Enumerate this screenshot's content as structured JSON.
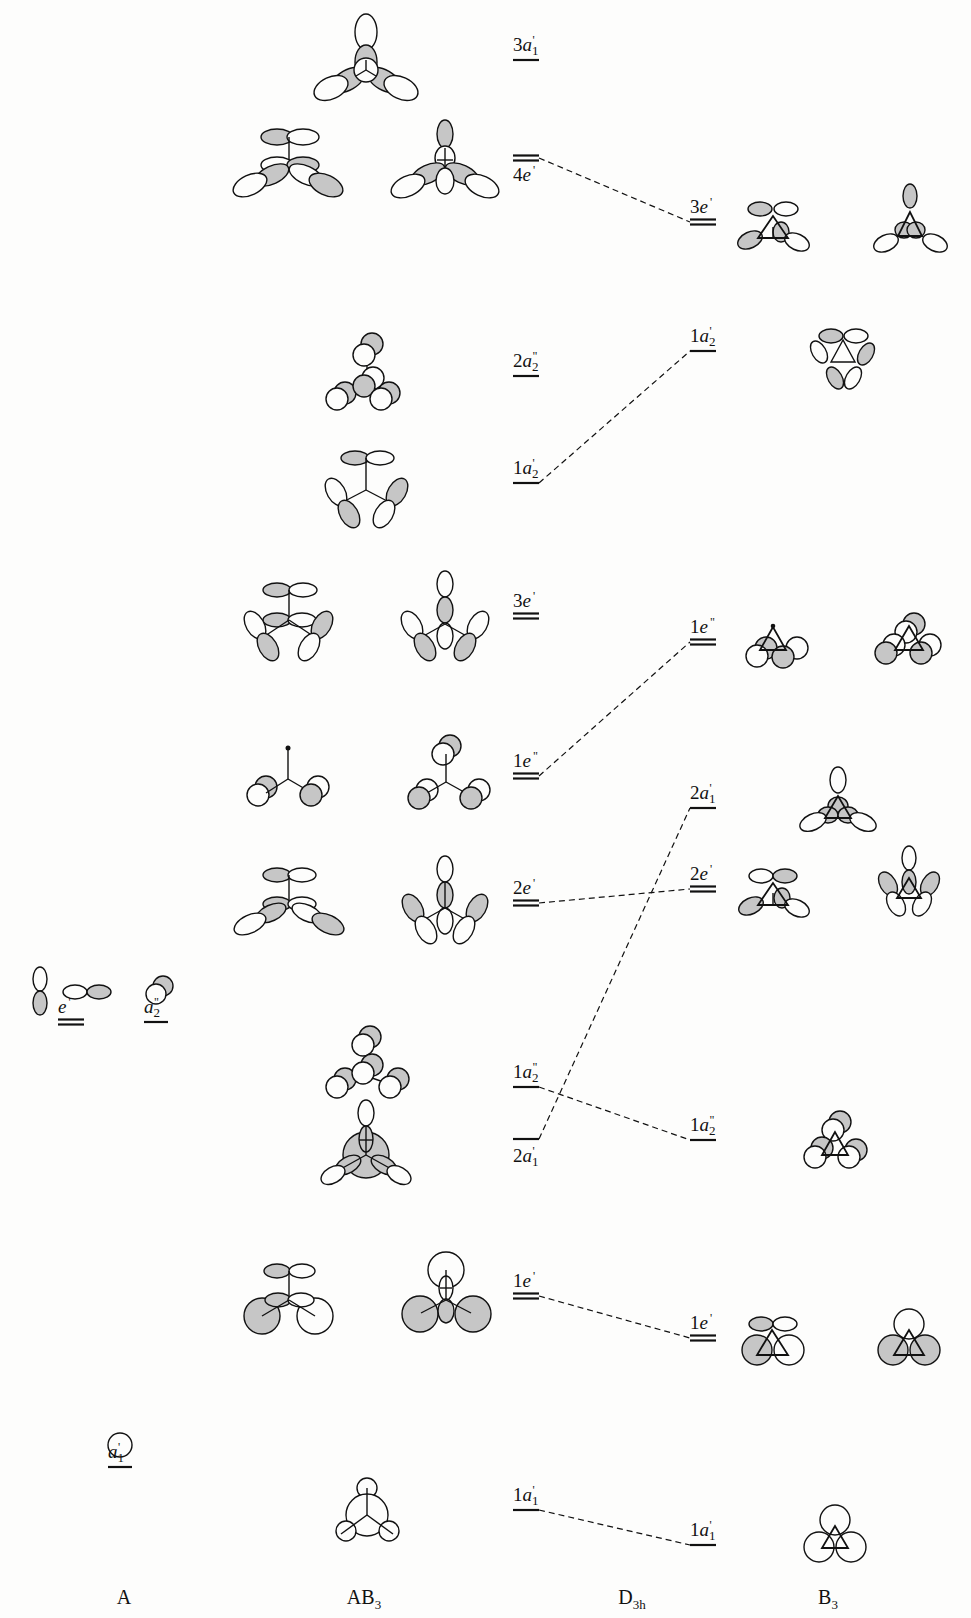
{
  "columns": [
    {
      "id": "A",
      "text": "A",
      "sub": "",
      "x": 124
    },
    {
      "id": "AB3",
      "text": "AB",
      "sub": "3",
      "x": 364
    },
    {
      "id": "D3h",
      "text": "D",
      "sub": "3h",
      "x": 632
    },
    {
      "id": "B3",
      "text": "B",
      "sub": "3",
      "x": 828
    }
  ],
  "levels": {
    "A": [
      {
        "id": "A-a1p",
        "num": "",
        "sym": "a",
        "sub": "1",
        "prime": "'",
        "y": 1467,
        "x": 108,
        "w": 24,
        "degenerate": false,
        "labelAbove": true
      },
      {
        "id": "A-ep",
        "num": "",
        "sym": "e",
        "sub": "",
        "prime": "'",
        "y": 1022,
        "x": 58,
        "w": 26,
        "degenerate": true,
        "labelAbove": true
      },
      {
        "id": "A-a2pp",
        "num": "",
        "sym": "a",
        "sub": "2",
        "prime": "\"",
        "y": 1022,
        "x": 144,
        "w": 24,
        "degenerate": false,
        "labelAbove": true
      }
    ],
    "AB3": [
      {
        "id": "AB3-3a1p",
        "num": "3",
        "sym": "a",
        "sub": "1",
        "prime": "'",
        "y": 60,
        "x": 513,
        "w": 26,
        "degenerate": false,
        "labelAbove": true
      },
      {
        "id": "AB3-4ep",
        "num": "4",
        "sym": "e",
        "sub": "",
        "prime": "'",
        "y": 158,
        "x": 513,
        "w": 26,
        "degenerate": true,
        "labelAbove": false
      },
      {
        "id": "AB3-2a2pp",
        "num": "2",
        "sym": "a",
        "sub": "2",
        "prime": "\"",
        "y": 376,
        "x": 513,
        "w": 26,
        "degenerate": false,
        "labelAbove": true
      },
      {
        "id": "AB3-1a2p",
        "num": "1",
        "sym": "a",
        "sub": "2",
        "prime": "'",
        "y": 483,
        "x": 513,
        "w": 26,
        "degenerate": false,
        "labelAbove": true
      },
      {
        "id": "AB3-3ep",
        "num": "3",
        "sym": "e",
        "sub": "",
        "prime": "'",
        "y": 616,
        "x": 513,
        "w": 26,
        "degenerate": true,
        "labelAbove": true
      },
      {
        "id": "AB3-1epp",
        "num": "1",
        "sym": "e",
        "sub": "",
        "prime": "\"",
        "y": 776,
        "x": 513,
        "w": 26,
        "degenerate": true,
        "labelAbove": true
      },
      {
        "id": "AB3-2ep",
        "num": "2",
        "sym": "e",
        "sub": "",
        "prime": "'",
        "y": 903,
        "x": 513,
        "w": 26,
        "degenerate": true,
        "labelAbove": true
      },
      {
        "id": "AB3-1a2pp",
        "num": "1",
        "sym": "a",
        "sub": "2",
        "prime": "\"",
        "y": 1087,
        "x": 513,
        "w": 26,
        "degenerate": false,
        "labelAbove": true
      },
      {
        "id": "AB3-2a1p",
        "num": "2",
        "sym": "a",
        "sub": "1",
        "prime": "'",
        "y": 1139,
        "x": 513,
        "w": 26,
        "degenerate": false,
        "labelAbove": false
      },
      {
        "id": "AB3-1ep",
        "num": "1",
        "sym": "e",
        "sub": "",
        "prime": "'",
        "y": 1296,
        "x": 513,
        "w": 26,
        "degenerate": true,
        "labelAbove": true
      },
      {
        "id": "AB3-1a1p",
        "num": "1",
        "sym": "a",
        "sub": "1",
        "prime": "'",
        "y": 1510,
        "x": 513,
        "w": 26,
        "degenerate": false,
        "labelAbove": true
      }
    ],
    "B3": [
      {
        "id": "B3-3ep",
        "num": "3",
        "sym": "e",
        "sub": "",
        "prime": "'",
        "y": 222,
        "x": 690,
        "w": 26,
        "degenerate": true,
        "labelAbove": true
      },
      {
        "id": "B3-1a2p",
        "num": "1",
        "sym": "a",
        "sub": "2",
        "prime": "'",
        "y": 351,
        "x": 690,
        "w": 26,
        "degenerate": false,
        "labelAbove": true
      },
      {
        "id": "B3-1epp",
        "num": "1",
        "sym": "e",
        "sub": "",
        "prime": "\"",
        "y": 642,
        "x": 690,
        "w": 26,
        "degenerate": true,
        "labelAbove": true
      },
      {
        "id": "B3-2a1p",
        "num": "2",
        "sym": "a",
        "sub": "1",
        "prime": "'",
        "y": 808,
        "x": 690,
        "w": 26,
        "degenerate": false,
        "labelAbove": true
      },
      {
        "id": "B3-2ep",
        "num": "2",
        "sym": "e",
        "sub": "",
        "prime": "'",
        "y": 889,
        "x": 690,
        "w": 26,
        "degenerate": true,
        "labelAbove": true
      },
      {
        "id": "B3-1a2pp",
        "num": "1",
        "sym": "a",
        "sub": "2",
        "prime": "\"",
        "y": 1140,
        "x": 690,
        "w": 26,
        "degenerate": false,
        "labelAbove": true
      },
      {
        "id": "B3-1ep",
        "num": "1",
        "sym": "e",
        "sub": "",
        "prime": "'",
        "y": 1338,
        "x": 690,
        "w": 26,
        "degenerate": true,
        "labelAbove": true
      },
      {
        "id": "B3-1a1p",
        "num": "1",
        "sym": "a",
        "sub": "1",
        "prime": "'",
        "y": 1545,
        "x": 690,
        "w": 26,
        "degenerate": false,
        "labelAbove": true
      }
    ]
  },
  "correlations": [
    {
      "from": "AB3-4ep",
      "to": "B3-3ep"
    },
    {
      "from": "AB3-1a2p",
      "to": "B3-1a2p"
    },
    {
      "from": "AB3-1epp",
      "to": "B3-1epp"
    },
    {
      "from": "AB3-2ep",
      "to": "B3-2ep"
    },
    {
      "from": "AB3-2a1p",
      "to": "B3-2a1p"
    },
    {
      "from": "AB3-1a2pp",
      "to": "B3-1a2pp"
    },
    {
      "from": "AB3-1ep",
      "to": "B3-1ep"
    },
    {
      "from": "AB3-1a1p",
      "to": "B3-1a1p"
    }
  ],
  "colors": {
    "ink": "#111111",
    "shade": "#c8c8c8",
    "paper": "#fdfdfc"
  }
}
